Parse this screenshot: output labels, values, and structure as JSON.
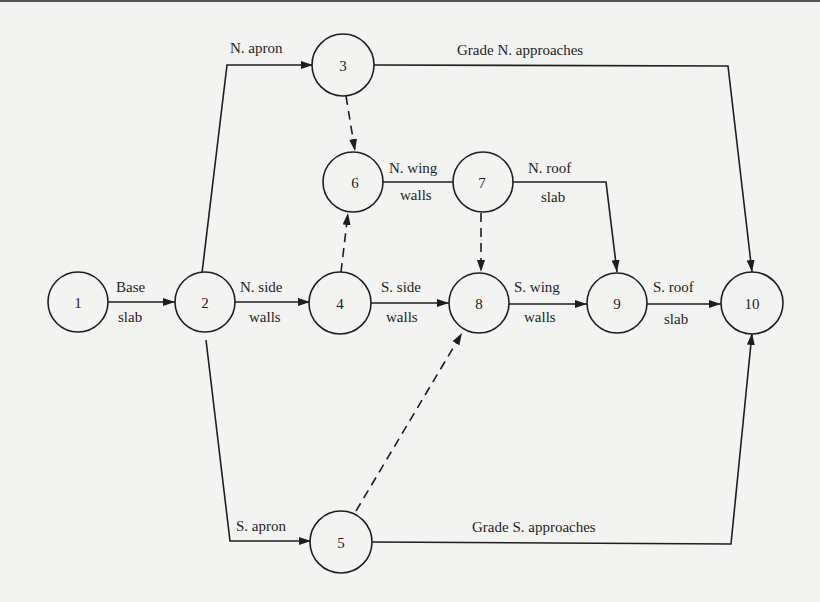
{
  "diagram": {
    "type": "activity-on-arrow network",
    "colors": {
      "background": "#f3f3f1",
      "ink": "#1e1e1e"
    },
    "nodes": [
      {
        "id": "1",
        "label": "1",
        "x": 78,
        "y": 302
      },
      {
        "id": "2",
        "label": "2",
        "x": 205,
        "y": 302
      },
      {
        "id": "3",
        "label": "3",
        "x": 343,
        "y": 65
      },
      {
        "id": "4",
        "label": "4",
        "x": 340,
        "y": 303
      },
      {
        "id": "5",
        "label": "5",
        "x": 341,
        "y": 542
      },
      {
        "id": "6",
        "label": "6",
        "x": 353,
        "y": 182
      },
      {
        "id": "7",
        "label": "7",
        "x": 483,
        "y": 182
      },
      {
        "id": "8",
        "label": "8",
        "x": 479,
        "y": 303
      },
      {
        "id": "9",
        "label": "9",
        "x": 617,
        "y": 303
      },
      {
        "id": "10",
        "label": "10",
        "x": 752,
        "y": 303
      }
    ],
    "activities": [
      {
        "from": "1",
        "to": "2",
        "label_top": "Base",
        "label_bottom": "slab",
        "dummy": false
      },
      {
        "from": "2",
        "to": "3",
        "label_top": "N. apron",
        "label_bottom": "",
        "dummy": false
      },
      {
        "from": "2",
        "to": "4",
        "label_top": "N. side",
        "label_bottom": "walls",
        "dummy": false
      },
      {
        "from": "2",
        "to": "5",
        "label_top": "S. apron",
        "label_bottom": "",
        "dummy": false
      },
      {
        "from": "3",
        "to": "10",
        "label_top": "Grade N. approaches",
        "label_bottom": "",
        "dummy": false
      },
      {
        "from": "3",
        "to": "6",
        "label_top": "",
        "label_bottom": "",
        "dummy": true
      },
      {
        "from": "4",
        "to": "6",
        "label_top": "",
        "label_bottom": "",
        "dummy": true
      },
      {
        "from": "6",
        "to": "7",
        "label_top": "N. wing",
        "label_bottom": "walls",
        "dummy": false
      },
      {
        "from": "7",
        "to": "9",
        "label_top": "N. roof",
        "label_bottom": "slab",
        "dummy": false
      },
      {
        "from": "7",
        "to": "8",
        "label_top": "",
        "label_bottom": "",
        "dummy": true
      },
      {
        "from": "4",
        "to": "8",
        "label_top": "S. side",
        "label_bottom": "walls",
        "dummy": false
      },
      {
        "from": "5",
        "to": "8",
        "label_top": "",
        "label_bottom": "",
        "dummy": true
      },
      {
        "from": "8",
        "to": "9",
        "label_top": "S. wing",
        "label_bottom": "walls",
        "dummy": false
      },
      {
        "from": "9",
        "to": "10",
        "label_top": "S. roof",
        "label_bottom": "slab",
        "dummy": false
      },
      {
        "from": "5",
        "to": "10",
        "label_top": "Grade S. approaches",
        "label_bottom": "",
        "dummy": false
      }
    ],
    "labels": {
      "base": "Base",
      "slab": "slab",
      "n_apron": "N. apron",
      "s_apron": "S. apron",
      "n_side": "N. side",
      "s_side": "S. side",
      "walls": "walls",
      "n_wing": "N. wing",
      "s_wing": "S. wing",
      "n_roof": "N. roof",
      "s_roof": "S. roof",
      "grade_n": "Grade N. approaches",
      "grade_s": "Grade S. approaches"
    }
  }
}
